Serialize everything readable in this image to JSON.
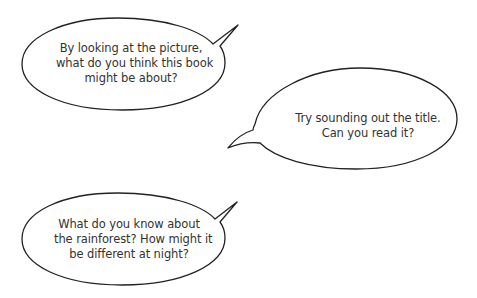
{
  "colors": {
    "background": "#ffffff",
    "outline": "#222222",
    "text": "#333333"
  },
  "bubbles": [
    {
      "id": "prompt-picture",
      "lines": [
        "By looking at the picture,",
        "what do you think this book",
        "might be about?"
      ],
      "tail": "top-right"
    },
    {
      "id": "prompt-title",
      "lines": [
        "Try sounding out the title.",
        "Can you read it?"
      ],
      "tail": "bottom-left"
    },
    {
      "id": "prompt-rainforest",
      "lines": [
        "What do you know about",
        "the rainforest? How might it",
        "be different at night?"
      ],
      "tail": "top-right"
    }
  ]
}
